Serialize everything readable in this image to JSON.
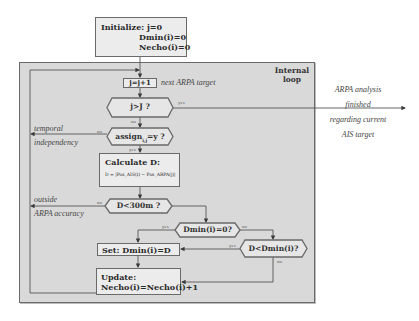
{
  "diagram": {
    "type": "flowchart",
    "colors": {
      "background": "#ffffff",
      "loop_region": "#d9d9d9",
      "box_fill": "#ececec",
      "border": "#6a6a6a",
      "line": "#555555"
    },
    "init": {
      "line1": "Initialize: j=0",
      "line2": "Dmin(i)=0",
      "line3": "Necho(i)=0"
    },
    "loop": {
      "title_line1": "Internal",
      "title_line2": "loop"
    },
    "increment": {
      "label": "j=j+1",
      "annotation": "next ARPA target"
    },
    "decision_j": {
      "label": "j>J ?",
      "yes_label": "yes",
      "no_label": "no"
    },
    "exit_text": {
      "line1": "ARPA analysis",
      "line2": "finished",
      "line3": "regarding current",
      "line4": "AIS target"
    },
    "decision_assign": {
      "label": "assign",
      "subscript": "i,j",
      "suffix": "=y ?",
      "yes_label": "yes",
      "no_label": "no"
    },
    "temporal_text": {
      "line1": "temporal",
      "line2": "independency"
    },
    "calculate": {
      "title": "Calculate D:",
      "formula": "D = |Pos_AIS(i) − Pos_ARPA(j)|"
    },
    "decision_300": {
      "label": "D<300m ?",
      "yes_label": "yes",
      "no_label": "no"
    },
    "outside_text": {
      "line1": "outside",
      "line2": "ARPA accuracy"
    },
    "decision_dmin0": {
      "label": "Dmin(i)=0?",
      "yes_label": "yes",
      "no_label": "no"
    },
    "decision_dless": {
      "label": "D<Dmin(i)?",
      "yes_label": "yes",
      "no_label": "no"
    },
    "set": {
      "label": "Set: Dmin(i)=D"
    },
    "update": {
      "line1": "Update:",
      "line2": "Necho(i)=Necho(i)+1"
    }
  }
}
